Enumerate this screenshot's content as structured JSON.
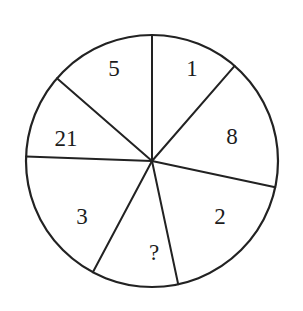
{
  "figure": {
    "kind": "pie-wheel-puzzle",
    "background_color": "#ffffff",
    "stroke_color": "#222222",
    "text_color": "#1c1c1c",
    "center": {
      "x": 152,
      "y": 161
    },
    "radius": 126
  },
  "chart_data": {
    "type": "pie",
    "title": "",
    "subtitle": "",
    "xlabel": "",
    "ylabel": "",
    "legend": [],
    "grid": false,
    "categories": [
      "1",
      "8",
      "2",
      "?",
      "3",
      "21",
      "5"
    ],
    "values": [
      49,
      53,
      66,
      40,
      64,
      53,
      41
    ],
    "labels": [
      "1",
      "8",
      "2",
      "?",
      "3",
      "21",
      "5"
    ],
    "annotations": [
      "?"
    ],
    "sectors": [
      {
        "label": "1",
        "start_angle_deg": 49,
        "end_angle_deg": 90,
        "label_x": 192,
        "label_y": 71
      },
      {
        "label": "8",
        "start_angle_deg": -12,
        "end_angle_deg": 49,
        "label_x": 232,
        "label_y": 139
      },
      {
        "label": "2",
        "start_angle_deg": -78,
        "end_angle_deg": -12,
        "label_x": 220,
        "label_y": 219
      },
      {
        "label": "?",
        "start_angle_deg": -118,
        "end_angle_deg": -78,
        "label_x": 154,
        "label_y": 255
      },
      {
        "label": "3",
        "start_angle_deg": -182,
        "end_angle_deg": -118,
        "label_x": 82,
        "label_y": 219
      },
      {
        "label": "21",
        "start_angle_deg": 139,
        "end_angle_deg": 178,
        "label_x": 66,
        "label_y": 141
      },
      {
        "label": "5",
        "start_angle_deg": 90,
        "end_angle_deg": 139,
        "label_x": 114,
        "label_y": 71
      }
    ],
    "spoke_angles_deg": [
      90,
      49,
      -12,
      -78,
      -118,
      178,
      139
    ]
  }
}
